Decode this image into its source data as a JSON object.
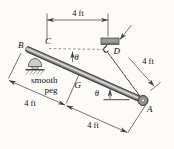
{
  "figure": {
    "points": {
      "B": "B",
      "C": "C",
      "D": "D",
      "G": "G",
      "A": "A"
    },
    "theta": "θ",
    "dims": {
      "top": "4 ft",
      "right": "4 ft",
      "left": "4 ft",
      "bottom": "4 ft"
    },
    "peg_label": {
      "line1": "smooth",
      "line2": "peg"
    }
  },
  "colors": {
    "background": "#fcfbf8",
    "line": "#3f3f3f",
    "text": "#101010",
    "rod_dark": "#474747",
    "rod_mid": "#8d8d8d",
    "rod_light": "#e6e6e6",
    "mount_fill": "#9c9c9c",
    "peg_fill": "#cccccc",
    "ring_outer": "#6b6b6b",
    "ring_inner": "#ededed"
  }
}
